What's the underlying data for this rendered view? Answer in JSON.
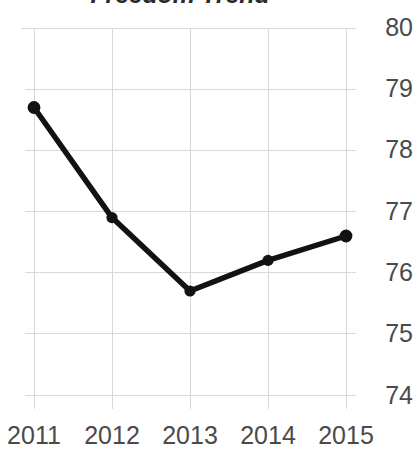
{
  "chart_data": {
    "type": "line",
    "title": "Freedom Trend",
    "xlabel": "",
    "ylabel": "",
    "categories": [
      "2011",
      "2012",
      "2013",
      "2014",
      "2015"
    ],
    "x": [
      2011,
      2012,
      2013,
      2014,
      2015
    ],
    "values": [
      78.7,
      76.9,
      75.7,
      76.2,
      76.6
    ],
    "series": [
      {
        "name": "Freedom Trend",
        "values": [
          78.7,
          76.9,
          75.7,
          76.2,
          76.6
        ]
      }
    ],
    "ylim": [
      74,
      80
    ],
    "y_ticks": [
      "80",
      "79",
      "78",
      "77",
      "76",
      "75",
      "74"
    ],
    "y_tick_values": [
      80,
      79,
      78,
      77,
      76,
      75,
      74
    ],
    "x_ticks": [
      "2011",
      "2012",
      "2013",
      "2014",
      "2015"
    ],
    "y_axis_position": "right",
    "grid": true,
    "legend": "none",
    "marker": "circle",
    "line_color": "#121212",
    "marker_color": "#121212",
    "grid_color": "#d8d8d8",
    "tick_label_color": "#4a4a4a",
    "title_color": "#2b2b2b"
  }
}
